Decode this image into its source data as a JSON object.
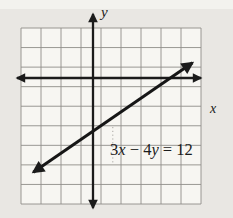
{
  "figure": {
    "labels": {
      "y_axis": "y",
      "x_axis": "x"
    },
    "equation_label": {
      "text": "3x − 4y = 12",
      "parts": [
        "3",
        "x",
        " − 4",
        "y",
        " = 12"
      ]
    }
  },
  "colors": {
    "paper": "#e9e7e3",
    "top_band": "#f3f2ee",
    "grid_area": "#f7f6f2",
    "grid_line": "#8e8d89",
    "dotted_line": "#a8a6a2",
    "ink": "#1b1b1b"
  },
  "chart_data": {
    "type": "line",
    "title": "",
    "equation": "3x − 4y = 12",
    "slope": 0.75,
    "x_intercept": [
      4,
      0
    ],
    "y_intercept": [
      0,
      -3
    ],
    "axes": {
      "x_label": "x",
      "y_label": "y",
      "x_range_shown": [
        -3.6,
        5.4
      ],
      "y_range_shown": [
        -6.4,
        2.6
      ],
      "arrows_both_ends": true
    },
    "grid": {
      "columns": 9,
      "rows": 9,
      "cell_units": 1,
      "grid_on": true,
      "pixel_bounds": {
        "left": 21,
        "top": 28,
        "right": 201,
        "bottom": 204
      }
    },
    "pixel_map": {
      "origin_x": 93,
      "origin_y": 78,
      "cell_w": 19.9,
      "cell_h": 19.56
    },
    "line_segment": {
      "x1": -3.0,
      "y1": -4.82,
      "x2": 5.0,
      "y2": 0.78
    }
  }
}
